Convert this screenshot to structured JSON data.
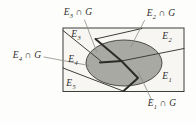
{
  "colors": {
    "background": "#fdfdfb",
    "rect_fill": "#f7f6f2",
    "ellipse_fill": "#a9a9a4",
    "ellipse_stroke": "#4a4a46",
    "line": "#3d3d3a",
    "thick_line": "#2b2b28",
    "leader": "#8b8b86",
    "text": "#2f2f2c"
  },
  "labels": {
    "regions": {
      "e1": {
        "base": "E",
        "sub": "1"
      },
      "e2": {
        "base": "E",
        "sub": "2"
      },
      "e3": {
        "base": "E",
        "sub": "3"
      },
      "e4": {
        "base": "E",
        "sub": "4"
      },
      "e5": {
        "base": "E",
        "sub": "5"
      }
    },
    "intersections": {
      "e1g": {
        "base": "E",
        "sub": "1",
        "rest": " ∩ G"
      },
      "e2g": {
        "base": "E",
        "sub": "2",
        "rest": " ∩ G"
      },
      "e3g": {
        "base": "E",
        "sub": "3",
        "rest": " ∩ G"
      },
      "e4g": {
        "base": "E",
        "sub": "4",
        "rest": " ∩ G"
      }
    }
  }
}
